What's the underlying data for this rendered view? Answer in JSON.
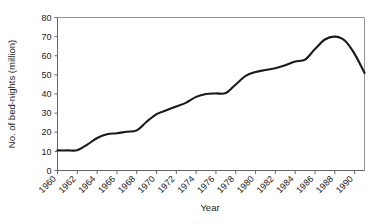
{
  "chart_data": {
    "type": "line",
    "title": "",
    "xlabel": "Year",
    "ylabel": "No. of bed-nights (million)",
    "xlim": [
      1960,
      1991
    ],
    "ylim": [
      0,
      80
    ],
    "ytick_step": 10,
    "xtick_step": 2,
    "grid": false,
    "legend": "none",
    "line_color": "#1a1a1a",
    "x_tick_labels": [
      "1960",
      "1962",
      "1964",
      "1966",
      "1968",
      "1970",
      "1972",
      "1974",
      "1976",
      "1978",
      "1980",
      "1982",
      "1984",
      "1986",
      "1988",
      "1990"
    ],
    "y_tick_labels": [
      "0",
      "10",
      "20",
      "30",
      "40",
      "50",
      "60",
      "70",
      "80"
    ],
    "x": [
      1960,
      1961,
      1962,
      1963,
      1964,
      1965,
      1966,
      1967,
      1968,
      1969,
      1970,
      1971,
      1972,
      1973,
      1974,
      1975,
      1976,
      1977,
      1978,
      1979,
      1980,
      1981,
      1982,
      1983,
      1984,
      1985,
      1986,
      1987,
      1988,
      1989,
      1990,
      1991
    ],
    "values": [
      10.5,
      10.5,
      10.6,
      13.5,
      17.0,
      19.0,
      19.5,
      20.3,
      21.0,
      25.5,
      29.5,
      31.5,
      33.5,
      35.5,
      38.5,
      40.0,
      40.3,
      40.5,
      45.0,
      49.5,
      51.5,
      52.5,
      53.5,
      55.0,
      57.0,
      58.0,
      63.5,
      68.5,
      70.0,
      68.0,
      61.0,
      51.0
    ],
    "series": [
      {
        "name": "No. of bed-nights (million)",
        "values": [
          10.5,
          10.5,
          10.6,
          13.5,
          17.0,
          19.0,
          19.5,
          20.3,
          21.0,
          25.5,
          29.5,
          31.5,
          33.5,
          35.5,
          38.5,
          40.0,
          40.3,
          40.5,
          45.0,
          49.5,
          51.5,
          52.5,
          53.5,
          55.0,
          57.0,
          58.0,
          63.5,
          68.5,
          70.0,
          68.0,
          61.0,
          51.0
        ]
      }
    ]
  }
}
